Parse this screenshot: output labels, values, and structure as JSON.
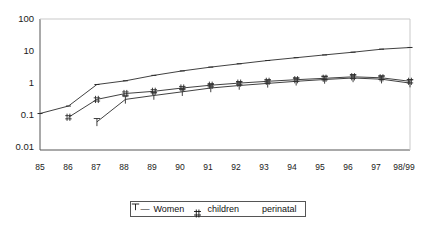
{
  "chart_data": {
    "type": "line",
    "title": "",
    "xlabel": "",
    "ylabel": "",
    "log_y": true,
    "ylim": [
      0.01,
      100
    ],
    "grid": false,
    "legend_position": "bottom",
    "y_ticks": [
      "100",
      "10",
      "1",
      "0.1",
      "0.01"
    ],
    "y_tick_values": [
      100,
      10,
      1,
      0.1,
      0.01
    ],
    "categories": [
      "85",
      "86",
      "87",
      "88",
      "89",
      "90",
      "91",
      "92",
      "93",
      "94",
      "95",
      "96",
      "97",
      "98/99"
    ],
    "series": [
      {
        "name": "Women",
        "marker": "dash",
        "values": [
          0.13,
          0.22,
          1.0,
          1.3,
          1.9,
          2.6,
          3.4,
          4.3,
          5.4,
          6.6,
          8.0,
          9.7,
          12.0,
          13.5
        ]
      },
      {
        "name": "children",
        "marker": "hash",
        "values": [
          null,
          0.1,
          0.35,
          0.53,
          0.62,
          0.78,
          0.95,
          1.1,
          1.25,
          1.4,
          1.55,
          1.72,
          1.6,
          1.25
        ]
      },
      {
        "name": "perinatal",
        "marker": "tee",
        "values": [
          null,
          null,
          0.072,
          0.35,
          0.46,
          0.6,
          0.78,
          0.93,
          1.08,
          1.25,
          1.42,
          1.58,
          1.45,
          1.1
        ]
      }
    ]
  },
  "legend": {
    "items": [
      {
        "label": "Women",
        "marker": "––"
      },
      {
        "label": "children",
        "marker": " "
      },
      {
        "label": "perinatal",
        "marker": "⊤"
      }
    ]
  },
  "axes": {
    "y_labels": [
      "100",
      "10",
      "1",
      "0.1",
      "0.01"
    ],
    "x_labels": [
      "85",
      "86",
      "87",
      "88",
      "89",
      "90",
      "91",
      "92",
      "93",
      "94",
      "95",
      "96",
      "97",
      "98/99"
    ]
  },
  "colors": {
    "line": "#2b2b2b",
    "frame": "#555555",
    "text": "#1a1a1a",
    "background": "#ffffff"
  }
}
